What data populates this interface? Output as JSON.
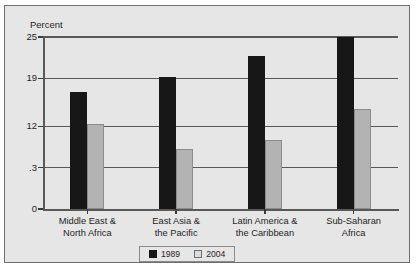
{
  "top_clipped_text": "……………………",
  "chart_data": {
    "type": "bar",
    "title": "",
    "xlabel": "",
    "ylabel": "Percent",
    "ylim": [
      0,
      25
    ],
    "grid": true,
    "legend_position": "bottom-center",
    "ytick_labels": [
      "25",
      "19",
      "12",
      ".3",
      "0"
    ],
    "ytick_values": [
      25,
      19,
      12,
      6,
      0
    ],
    "categories": [
      [
        "Middle East &",
        "North Africa"
      ],
      [
        "East Asia &",
        "the Pacific"
      ],
      [
        "Latin America &",
        "the Caribbean"
      ],
      [
        "Sub-Saharan",
        "Africa"
      ]
    ],
    "series": [
      {
        "name": "1989",
        "color": "#171717",
        "values": [
          17.0,
          19.2,
          22.3,
          25.0
        ]
      },
      {
        "name": "2004",
        "color": "#b3b3b3",
        "values": [
          12.4,
          8.7,
          10.0,
          14.5
        ]
      }
    ]
  }
}
